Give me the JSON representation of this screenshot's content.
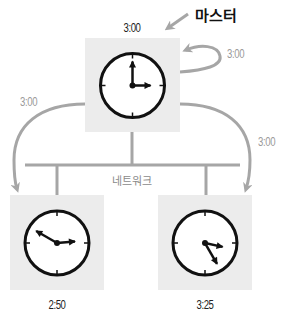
{
  "diagram": {
    "master_label": "마스터",
    "network_label": "네트워크",
    "master_clock": {
      "time": "3:00",
      "hour": 3,
      "minute": 0
    },
    "sync_messages": {
      "self": "3:00",
      "to_left": "3:00",
      "to_right": "3:00"
    },
    "clients": [
      {
        "name": "left-client",
        "time": "2:50",
        "hour": 2,
        "minute": 50
      },
      {
        "name": "right-client",
        "time": "3:25",
        "hour": 3,
        "minute": 25
      }
    ],
    "colors": {
      "box_fill": "#ececec",
      "arrow_grey": "#a6a6a6",
      "clock_stroke": "#111111",
      "network_line": "#a6a6a6"
    }
  }
}
